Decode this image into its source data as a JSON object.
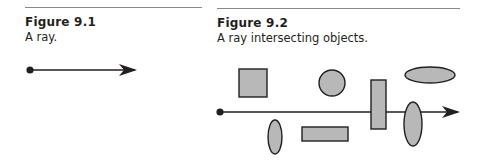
{
  "figures": [
    {
      "title": "Figure 9.1",
      "caption": "A ray.",
      "diagram": {
        "ray": {
          "origin": [
            30,
            70
          ],
          "tip": [
            135,
            70
          ]
        }
      }
    },
    {
      "title": "Figure 9.2",
      "caption": "A ray intersecting objects.",
      "diagram": {
        "ray": {
          "origin": [
            220,
            112
          ],
          "tip": [
            458,
            112
          ]
        },
        "objects": [
          {
            "shape": "square",
            "x": 239,
            "y": 69,
            "w": 28,
            "h": 28
          },
          {
            "shape": "circle",
            "cx": 332,
            "cy": 83,
            "r": 13
          },
          {
            "shape": "ellipse",
            "cx": 430,
            "cy": 75,
            "rx": 25,
            "ry": 8
          },
          {
            "shape": "rect",
            "x": 371,
            "y": 80,
            "w": 15,
            "h": 49
          },
          {
            "shape": "ellipse",
            "cx": 275,
            "cy": 137,
            "rx": 7,
            "ry": 17
          },
          {
            "shape": "rect",
            "x": 302,
            "y": 127,
            "w": 46,
            "h": 14
          },
          {
            "shape": "ellipse",
            "cx": 413,
            "cy": 124,
            "rx": 9,
            "ry": 22
          }
        ]
      }
    }
  ],
  "colors": {
    "ink": "#231f20",
    "fill": "#b8b8b8",
    "rule": "#8a8a8a"
  }
}
